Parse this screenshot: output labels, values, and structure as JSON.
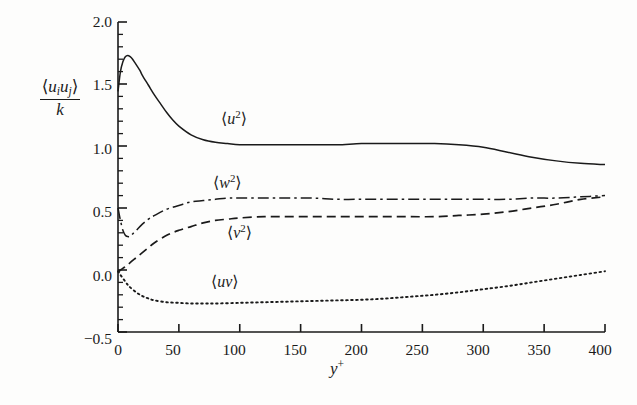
{
  "figure": {
    "background_color": "#fdfdfc",
    "ink_color": "#1a1a1a"
  },
  "axis_labels": {
    "y_numerator_open": "⟨",
    "y_numerator_u1": "u",
    "y_numerator_sub1": "i",
    "y_numerator_u2": "u",
    "y_numerator_sub2": "j",
    "y_numerator_close": "⟩",
    "y_denominator": "k",
    "x_label_base": "y",
    "x_label_sup": "+"
  },
  "chart_data": {
    "type": "line",
    "title": "",
    "subtitle": "",
    "xlabel": "y+",
    "ylabel": "⟨u_i u_j⟩ / k",
    "xlim": [
      0,
      400
    ],
    "ylim": [
      -0.5,
      2.0
    ],
    "xticks": [
      0,
      50,
      100,
      150,
      200,
      250,
      300,
      350,
      400
    ],
    "xtick_labels": [
      "0",
      "50",
      "100",
      "150",
      "200",
      "250",
      "300",
      "350",
      "400"
    ],
    "yticks": [
      -0.5,
      0.0,
      0.5,
      1.0,
      1.5,
      2.0
    ],
    "ytick_labels": [
      "−0.5",
      "0.0",
      "0.5",
      "1.0",
      "1.5",
      "2.0"
    ],
    "y_minor_tick_step": 0.1,
    "grid": false,
    "legend": "inline-annotations",
    "legend_position": "inline",
    "series": [
      {
        "name": "⟨u2⟩",
        "label_text_open": "⟨",
        "label_base": "u",
        "label_sup": "2",
        "label_text_close": "⟩",
        "linestyle": "solid",
        "color": "#1a1a1a",
        "x": [
          0,
          2,
          4,
          6,
          8,
          10,
          12,
          14,
          16,
          18,
          20,
          25,
          30,
          35,
          40,
          45,
          50,
          60,
          70,
          80,
          90,
          100,
          120,
          140,
          160,
          180,
          200,
          220,
          240,
          260,
          280,
          300,
          320,
          340,
          360,
          380,
          400
        ],
        "values": [
          1.44,
          1.6,
          1.68,
          1.72,
          1.73,
          1.72,
          1.7,
          1.67,
          1.64,
          1.61,
          1.57,
          1.49,
          1.41,
          1.34,
          1.27,
          1.21,
          1.16,
          1.09,
          1.05,
          1.03,
          1.02,
          1.01,
          1.01,
          1.01,
          1.01,
          1.01,
          1.02,
          1.02,
          1.02,
          1.02,
          1.01,
          0.99,
          0.95,
          0.91,
          0.88,
          0.86,
          0.85
        ]
      },
      {
        "name": "⟨w2⟩",
        "label_text_open": "⟨",
        "label_base": "w",
        "label_sup": "2",
        "label_text_close": "⟩",
        "linestyle": "dashdot",
        "color": "#1a1a1a",
        "x": [
          0,
          2,
          4,
          6,
          8,
          10,
          12,
          15,
          20,
          25,
          30,
          40,
          50,
          60,
          70,
          80,
          90,
          100,
          120,
          140,
          160,
          180,
          200,
          220,
          240,
          260,
          280,
          300,
          320,
          340,
          360,
          380,
          400
        ],
        "values": [
          0.5,
          0.4,
          0.32,
          0.28,
          0.27,
          0.27,
          0.29,
          0.32,
          0.37,
          0.41,
          0.44,
          0.49,
          0.52,
          0.55,
          0.56,
          0.57,
          0.58,
          0.58,
          0.58,
          0.58,
          0.58,
          0.57,
          0.57,
          0.57,
          0.57,
          0.57,
          0.57,
          0.57,
          0.57,
          0.58,
          0.58,
          0.59,
          0.6
        ]
      },
      {
        "name": "⟨v2⟩",
        "label_text_open": "⟨",
        "label_base": "v",
        "label_sup": "2",
        "label_text_close": "⟩",
        "linestyle": "dashed",
        "color": "#1a1a1a",
        "x": [
          0,
          2,
          5,
          8,
          10,
          15,
          20,
          25,
          30,
          40,
          50,
          60,
          70,
          80,
          90,
          100,
          120,
          140,
          160,
          180,
          200,
          220,
          240,
          260,
          280,
          300,
          320,
          340,
          360,
          380,
          400
        ],
        "values": [
          -0.02,
          0.0,
          0.02,
          0.04,
          0.06,
          0.1,
          0.14,
          0.18,
          0.22,
          0.28,
          0.32,
          0.35,
          0.38,
          0.4,
          0.41,
          0.42,
          0.43,
          0.43,
          0.43,
          0.43,
          0.43,
          0.43,
          0.43,
          0.43,
          0.44,
          0.45,
          0.47,
          0.5,
          0.53,
          0.57,
          0.59
        ]
      },
      {
        "name": "⟨uv⟩",
        "label_text_open": "⟨",
        "label_base": "uv",
        "label_sup": "",
        "label_text_close": "⟩",
        "linestyle": "dotted",
        "color": "#1a1a1a",
        "x": [
          0,
          2,
          5,
          8,
          10,
          15,
          20,
          25,
          30,
          40,
          50,
          60,
          70,
          80,
          100,
          120,
          140,
          160,
          180,
          200,
          220,
          240,
          260,
          280,
          300,
          320,
          340,
          360,
          380,
          400
        ],
        "values": [
          -0.01,
          -0.04,
          -0.08,
          -0.12,
          -0.14,
          -0.18,
          -0.21,
          -0.23,
          -0.245,
          -0.26,
          -0.265,
          -0.27,
          -0.27,
          -0.27,
          -0.265,
          -0.26,
          -0.255,
          -0.25,
          -0.245,
          -0.24,
          -0.23,
          -0.215,
          -0.2,
          -0.18,
          -0.155,
          -0.13,
          -0.1,
          -0.07,
          -0.04,
          -0.01
        ]
      }
    ]
  },
  "tick_labels": {
    "y": [
      "2.0",
      "1.5",
      "1.0",
      "0.5",
      "0.0",
      "−0.5"
    ],
    "x": [
      "0",
      "50",
      "100",
      "150",
      "200",
      "250",
      "300",
      "350",
      "400"
    ]
  }
}
